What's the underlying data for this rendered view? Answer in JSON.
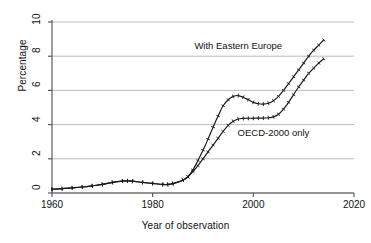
{
  "chart_data": {
    "type": "line",
    "title": "",
    "subtitle": "",
    "xlabel": "Year of observation",
    "ylabel": "Percentage",
    "xlim": [
      1960,
      2020
    ],
    "ylim": [
      0,
      10
    ],
    "xticks": [
      1960,
      1980,
      2000,
      2020
    ],
    "yticks": [
      0,
      2,
      4,
      6,
      8,
      10
    ],
    "grid": "horizontal",
    "legend_position": "inline-annotations",
    "annotations": [
      {
        "text": "With Eastern Europe",
        "x": 1997,
        "y": 8.6
      },
      {
        "text": "OECD-2000 only",
        "x": 2004,
        "y": 3.5
      }
    ],
    "series": [
      {
        "name": "With Eastern Europe",
        "marker": "tick",
        "x": [
          1960,
          1962,
          1964,
          1966,
          1968,
          1970,
          1972,
          1974,
          1975,
          1976,
          1978,
          1980,
          1982,
          1983,
          1984,
          1986,
          1987,
          1988,
          1989,
          1990,
          1991,
          1992,
          1993,
          1994,
          1995,
          1996,
          1997,
          1998,
          1999,
          2000,
          2001,
          2002,
          2003,
          2004,
          2005,
          2006,
          2007,
          2008,
          2009,
          2010,
          2011,
          2012,
          2013,
          2014
        ],
        "values": [
          0.22,
          0.25,
          0.3,
          0.35,
          0.42,
          0.5,
          0.62,
          0.7,
          0.71,
          0.69,
          0.62,
          0.56,
          0.5,
          0.5,
          0.55,
          0.75,
          0.95,
          1.35,
          1.9,
          2.5,
          3.15,
          3.85,
          4.5,
          5.1,
          5.45,
          5.65,
          5.7,
          5.6,
          5.45,
          5.3,
          5.22,
          5.2,
          5.25,
          5.4,
          5.65,
          6.0,
          6.4,
          6.8,
          7.2,
          7.6,
          8.0,
          8.35,
          8.65,
          8.95
        ]
      },
      {
        "name": "OECD-2000 only",
        "marker": "tick",
        "x": [
          1960,
          1962,
          1964,
          1966,
          1968,
          1970,
          1972,
          1974,
          1975,
          1976,
          1978,
          1980,
          1982,
          1983,
          1984,
          1986,
          1987,
          1988,
          1989,
          1990,
          1991,
          1992,
          1993,
          1994,
          1995,
          1996,
          1997,
          1998,
          1999,
          2000,
          2001,
          2002,
          2003,
          2004,
          2005,
          2006,
          2007,
          2008,
          2009,
          2010,
          2011,
          2012,
          2013,
          2014
        ],
        "values": [
          0.22,
          0.25,
          0.3,
          0.35,
          0.42,
          0.5,
          0.62,
          0.7,
          0.71,
          0.69,
          0.62,
          0.56,
          0.5,
          0.5,
          0.55,
          0.75,
          0.95,
          1.25,
          1.6,
          2.0,
          2.4,
          2.8,
          3.2,
          3.6,
          3.95,
          4.2,
          4.33,
          4.36,
          4.37,
          4.37,
          4.38,
          4.38,
          4.4,
          4.45,
          4.6,
          4.9,
          5.3,
          5.75,
          6.2,
          6.6,
          7.0,
          7.3,
          7.6,
          7.85
        ]
      }
    ]
  },
  "axes": {
    "xtick_labels": [
      "1960",
      "1980",
      "2000",
      "2020"
    ],
    "ytick_labels": [
      "0",
      "2",
      "4",
      "6",
      "8",
      "10"
    ]
  },
  "style": {
    "line_color": "#1a1a1a",
    "grid_color": "#b4b4b4",
    "axis_color": "#4d4d4d",
    "background": "#ffffff"
  }
}
